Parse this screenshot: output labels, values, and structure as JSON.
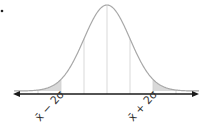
{
  "diagram": {
    "type": "normal-distribution-curve",
    "marker": "•",
    "mean_label_symbol": "x̄",
    "labels": [
      {
        "id": "lower",
        "text": "x̄ − 2σ"
      },
      {
        "id": "upper",
        "text": "x̄ + 2σ"
      }
    ],
    "shaded_regions": [
      "left tail beyond x̄ − 2σ",
      "right tail beyond x̄ + 2σ"
    ],
    "vertical_lines_at_sigma": [
      -3,
      -2,
      -1,
      0,
      1,
      2,
      3
    ],
    "colors": {
      "curve": "#a8a8a8",
      "shade": "#d9d9d9",
      "axis": "#1a1a1a",
      "guides": "#cfcfcf"
    }
  }
}
